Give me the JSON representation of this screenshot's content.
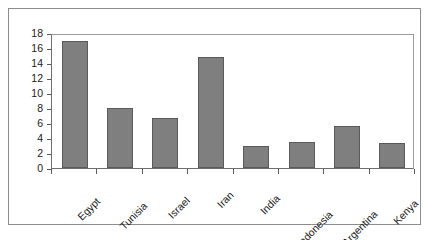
{
  "chart_data": {
    "type": "bar",
    "title": "",
    "subtitle": "",
    "xlabel": "",
    "ylabel": "",
    "categories": [
      "Egypt",
      "Tunisia",
      "Israel",
      "Iran",
      "India",
      "Indonesia",
      "Argentina",
      "Kenya"
    ],
    "values": [
      17,
      8,
      6.7,
      14.8,
      2.9,
      3.5,
      5.6,
      3.4
    ],
    "ylim": [
      0,
      18
    ],
    "ytick_labels": [
      "18",
      "16",
      "14",
      "12",
      "10",
      "8",
      "6",
      "4",
      "2",
      "0"
    ],
    "ytick_values": [
      18,
      16,
      14,
      12,
      10,
      8,
      6,
      4,
      2,
      0
    ],
    "grid": false,
    "legend": null,
    "legend_position": "none",
    "annotations": [],
    "colors": {
      "bar_fill": "#7f7f7f",
      "bar_border": "#5a5a5a",
      "plot_background": "#ffffff",
      "axis_line": "#6e6e6e",
      "frame_border": "#8d8d8d",
      "text": "#1a1a1a"
    },
    "xtick_label_rotation": -45
  }
}
